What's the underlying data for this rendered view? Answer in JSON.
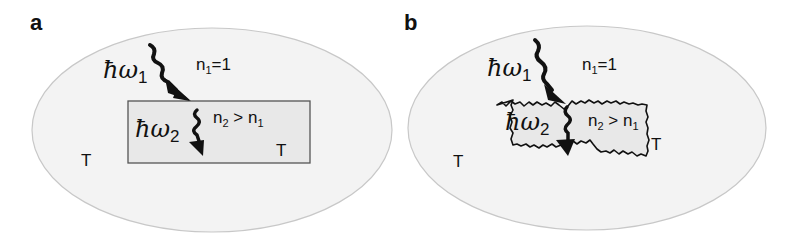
{
  "figure": {
    "panels": [
      {
        "id": "a",
        "label": "a",
        "photon1": {
          "symbol": "ħω",
          "subscript": "1"
        },
        "photon2": {
          "symbol": "ħω",
          "subscript": "2"
        },
        "outer_medium": {
          "n": "n",
          "sub": "1",
          "rest": "=1"
        },
        "inner_medium": {
          "n": "n",
          "sub": "2",
          "mid": " > n",
          "sub2": "1"
        },
        "temp_outer": "T",
        "temp_inner": "T",
        "interface": "smooth"
      },
      {
        "id": "b",
        "label": "b",
        "photon1": {
          "symbol": "ħω",
          "subscript": "1"
        },
        "photon2": {
          "symbol": "ħω",
          "subscript": "2"
        },
        "outer_medium": {
          "n": "n",
          "sub": "1",
          "rest": "=1"
        },
        "inner_medium": {
          "n": "n",
          "sub": "2",
          "mid": " > n",
          "sub2": "1"
        },
        "temp_outer": "T",
        "temp_inner": "T",
        "interface": "rough"
      }
    ],
    "colors": {
      "ellipse_fill": "#f3f3f3",
      "ellipse_stroke": "#c8c8c8",
      "inner_fill": "#e8e8e8",
      "ink": "#111111"
    }
  }
}
